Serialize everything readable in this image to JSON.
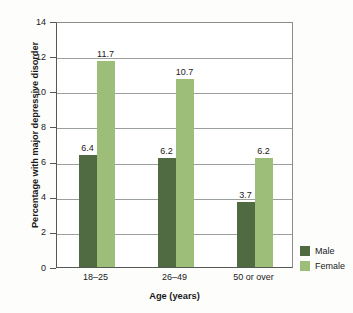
{
  "chart_data": {
    "type": "bar",
    "title": "",
    "xlabel": "Age (years)",
    "ylabel": "Percentage with major depressive disorder",
    "categories": [
      "18–25",
      "26–49",
      "50 or over"
    ],
    "series": [
      {
        "name": "Male",
        "color": "#506B41",
        "values": [
          6.4,
          6.2,
          3.7
        ]
      },
      {
        "name": "Female",
        "color": "#9CBE78",
        "values": [
          11.7,
          10.7,
          6.2
        ]
      }
    ],
    "ylim": [
      0,
      14
    ],
    "yticks": [
      0,
      2,
      4,
      6,
      8,
      10,
      12,
      14
    ],
    "ytick_labels": [
      "0",
      "2",
      "4",
      "6",
      "8",
      "10",
      "12",
      "14"
    ],
    "grid": true,
    "grid_axis": "y",
    "legend_position": "right-bottom",
    "data_labels": [
      "6.4",
      "11.7",
      "6.2",
      "10.7",
      "3.7",
      "6.2"
    ]
  },
  "axes": {
    "y_title": "Percentage with major depressive disorder",
    "x_title": "Age (years)"
  },
  "legend": {
    "items": [
      {
        "label": "Male",
        "color": "#506B41"
      },
      {
        "label": "Female",
        "color": "#9CBE78"
      }
    ]
  }
}
